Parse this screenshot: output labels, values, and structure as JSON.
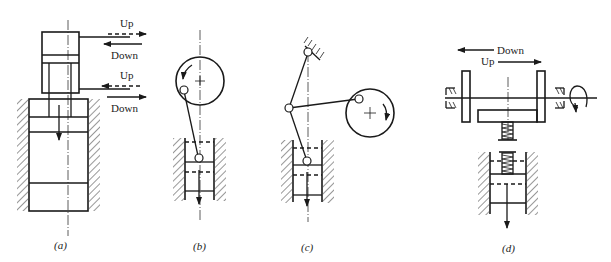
{
  "figure": {
    "panels": [
      {
        "id": "a",
        "caption": "(a)",
        "type": "hydraulic-cylinder-press",
        "labels": {
          "upper_up": "Up",
          "upper_down": "Down",
          "lower_up": "Up",
          "lower_down": "Down"
        }
      },
      {
        "id": "b",
        "caption": "(b)",
        "type": "crank-slider-press",
        "rotation": "counterclockwise"
      },
      {
        "id": "c",
        "caption": "(c)",
        "type": "toggle-link-press",
        "rotation": "clockwise"
      },
      {
        "id": "d",
        "caption": "(d)",
        "type": "friction-screw-press",
        "labels": {
          "down": "Down",
          "up": "Up"
        }
      }
    ],
    "colors": {
      "line": "#1a1a1a",
      "background": "#ffffff"
    }
  }
}
